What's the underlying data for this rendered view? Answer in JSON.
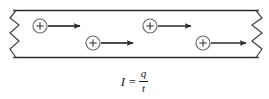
{
  "figure": {
    "colors": {
      "stroke": "#2b2b2b",
      "charge_stroke": "#555555",
      "arrow": "#2b2b2b",
      "background": "#ffffff",
      "text": "#1a1a1a"
    },
    "conductor": {
      "label": "conductor-wire",
      "top_y": 10,
      "bottom_y": 58,
      "left_break_x": 10,
      "right_break_x": 262,
      "break_symbol": "zigzag"
    },
    "charges": [
      {
        "label": "+",
        "name": "positive-charge-1",
        "cx": 40,
        "cy": 26,
        "r": 7,
        "arrow_start_x": 48,
        "arrow_end_x": 82,
        "arrow_y": 26
      },
      {
        "label": "+",
        "name": "positive-charge-2",
        "cx": 93,
        "cy": 43,
        "r": 7,
        "arrow_start_x": 101,
        "arrow_end_x": 135,
        "arrow_y": 43
      },
      {
        "label": "+",
        "name": "positive-charge-3",
        "cx": 150,
        "cy": 26,
        "r": 7,
        "arrow_start_x": 158,
        "arrow_end_x": 193,
        "arrow_y": 26
      },
      {
        "label": "+",
        "name": "positive-charge-4",
        "cx": 203,
        "cy": 43,
        "r": 7,
        "arrow_start_x": 211,
        "arrow_end_x": 248,
        "arrow_y": 43
      }
    ],
    "formula": {
      "variable": "I",
      "equals": "=",
      "numerator": "q",
      "denominator": "t",
      "plain": "I = q/t"
    }
  }
}
